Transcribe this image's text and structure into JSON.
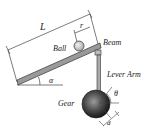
{
  "diagram": {
    "labels": {
      "length": "L",
      "ball_position": "r",
      "ball": "Ball",
      "beam": "Beam",
      "beam_angle": "α",
      "lever_arm": "Lever Arm",
      "gear": "Gear",
      "gear_angle": "θ",
      "lever_offset": "d"
    },
    "colors": {
      "line": "#333333",
      "beam_fill": "#9a9a9a",
      "ball_fill": "#cfcfcf",
      "gear_dark": "#1e1e1e",
      "gear_light": "#8a8a8a"
    }
  }
}
